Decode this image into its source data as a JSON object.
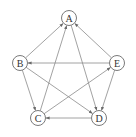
{
  "diagram": {
    "type": "directed-graph",
    "node_radius": 7.5,
    "colors": {
      "node_stroke": "#7a7a7a",
      "edge": "#8a8a8a",
      "label": "#333333",
      "background": "#ffffff"
    },
    "nodes": [
      {
        "id": "A",
        "label": "A",
        "x": 69,
        "y": 18
      },
      {
        "id": "B",
        "label": "B",
        "x": 20,
        "y": 63
      },
      {
        "id": "C",
        "label": "C",
        "x": 38,
        "y": 118
      },
      {
        "id": "D",
        "label": "D",
        "x": 99,
        "y": 118
      },
      {
        "id": "E",
        "label": "E",
        "x": 117,
        "y": 63
      }
    ],
    "edges": [
      {
        "from": "B",
        "to": "A"
      },
      {
        "from": "C",
        "to": "A"
      },
      {
        "from": "E",
        "to": "A"
      },
      {
        "from": "A",
        "to": "D"
      },
      {
        "from": "E",
        "to": "B"
      },
      {
        "from": "B",
        "to": "C"
      },
      {
        "from": "B",
        "to": "D"
      },
      {
        "from": "C",
        "to": "E"
      },
      {
        "from": "E",
        "to": "D"
      },
      {
        "from": "D",
        "to": "C"
      }
    ]
  }
}
